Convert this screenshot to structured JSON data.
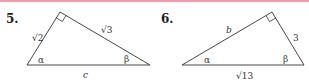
{
  "colors": {
    "top_rule": "#e8a0a8",
    "line": "#333333",
    "text": "#222222"
  },
  "problems": [
    {
      "number": "5.",
      "triangle": {
        "vertices": {
          "left": [
            27,
            65
          ],
          "apex": [
            60,
            12
          ],
          "right": [
            150,
            65
          ]
        },
        "right_angle_at": "apex",
        "labels": {
          "left_leg": "√2",
          "right_leg": "√3",
          "hypotenuse": "c",
          "angle_left": "α",
          "angle_right": "β"
        }
      }
    },
    {
      "number": "6.",
      "triangle": {
        "vertices": {
          "left": [
            182,
            65
          ],
          "apex": [
            272,
            12
          ],
          "right": [
            304,
            65
          ]
        },
        "right_angle_at": "apex",
        "labels": {
          "left_leg": "b",
          "right_leg": "3",
          "hypotenuse": "√13",
          "angle_left": "α",
          "angle_right": "β"
        }
      }
    }
  ]
}
